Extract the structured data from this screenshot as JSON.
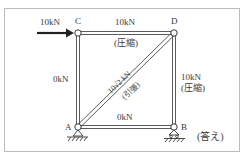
{
  "diagram": {
    "type": "truss",
    "nodes": {
      "A": {
        "label": "A"
      },
      "B": {
        "label": "B"
      },
      "C": {
        "label": "C"
      },
      "D": {
        "label": "D"
      }
    },
    "load": {
      "label": "10kN",
      "at": "C",
      "direction": "right"
    },
    "members": {
      "CD": {
        "force": "10kN",
        "state": "(圧縮)"
      },
      "AC": {
        "force": "0kN",
        "state": ""
      },
      "BD": {
        "force": "10kN",
        "state": "(圧縮)"
      },
      "AB": {
        "force": "0kN",
        "state": ""
      },
      "AD": {
        "force": "10√2 kN",
        "state": "(引張)"
      }
    },
    "supports": {
      "A": "pin",
      "B": "roller"
    },
    "answer_label": "(答え)",
    "colors": {
      "member": "#4a4a4a",
      "frame": "#bdbdbd",
      "text": "#3a3a3a"
    }
  }
}
